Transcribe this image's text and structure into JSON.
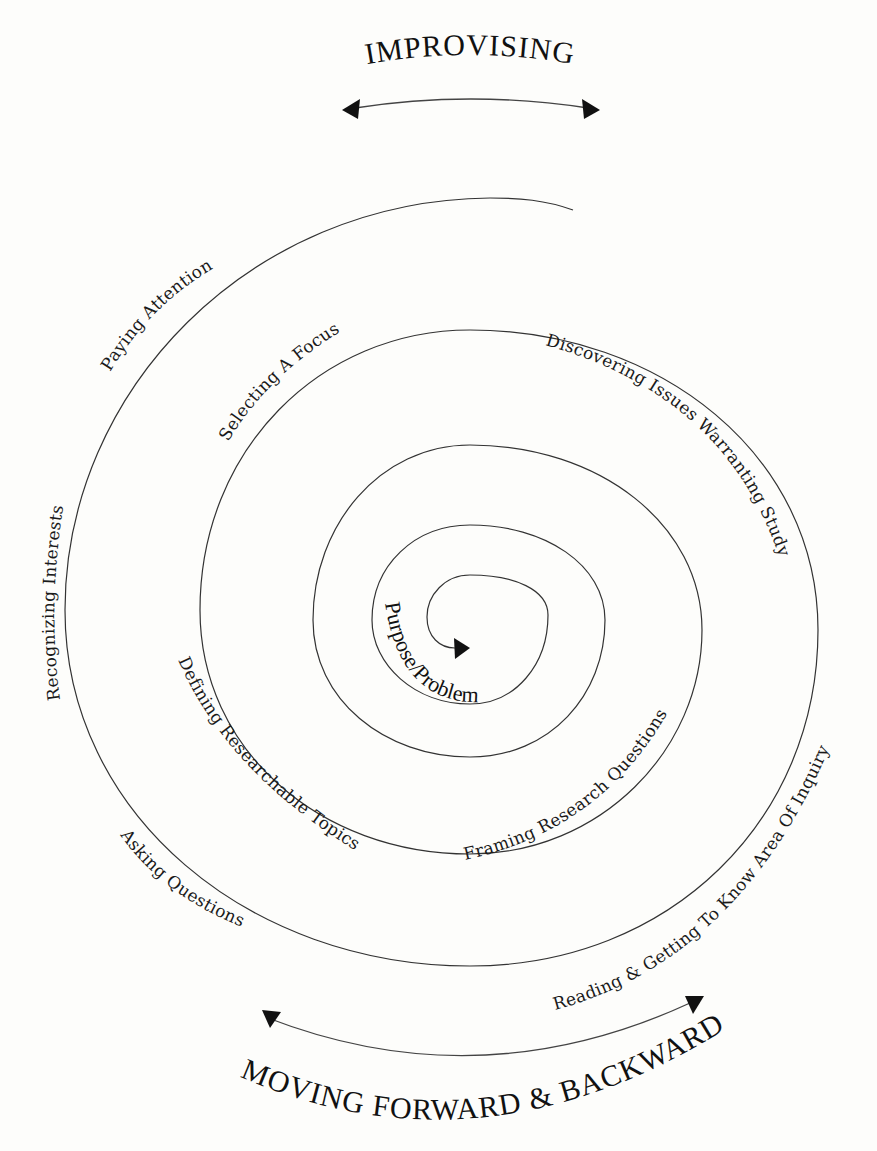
{
  "title_top": "IMPROVISING",
  "title_bottom": "MOVING FORWARD & BACKWARD",
  "center_label": "Purpose/Problem",
  "stages": {
    "paying_attention": "Paying Attention",
    "recognizing_interests": "Recognizing Interests",
    "asking_questions": "Asking Questions",
    "reading": "Reading & Getting To Know Area Of Inquiry",
    "discovering": "Discovering Issues Warranting Study",
    "selecting_focus": "Selecting A Focus",
    "defining_topics": "Defining Researchable Topics",
    "framing_questions": "Framing Research Questions"
  },
  "icons": {
    "top_arrow": "double-headed-curved-arrow",
    "bottom_arrow": "double-headed-curved-arrow",
    "spiral_end": "arrowhead"
  },
  "colors": {
    "ink": "#111111",
    "line": "#333333",
    "background": "#fdfdfb"
  }
}
